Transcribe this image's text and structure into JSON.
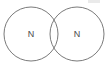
{
  "figure": {
    "type": "venn-two-circle",
    "background_color": "#ffffff",
    "stroke_color": "#7a7a7a",
    "stroke_width": 1,
    "label_color": "#4a4a4a",
    "width": 108,
    "height": 68
  },
  "circles": [
    {
      "id": "left-ring",
      "label": "N",
      "cx": 31,
      "cy": 34,
      "r": 27
    },
    {
      "id": "right-ring",
      "label": "N",
      "cx": 77,
      "cy": 34,
      "r": 27
    }
  ],
  "artifact": {
    "name": "scan-smudge",
    "x": 88,
    "y": 0,
    "width": 12,
    "height": 3
  }
}
